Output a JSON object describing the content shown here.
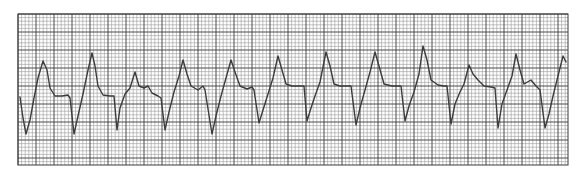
{
  "chart_data": {
    "type": "line",
    "title": "",
    "xlabel": "",
    "ylabel": "",
    "grid": true,
    "grid_box": {
      "x": 18,
      "y": 14,
      "width": 550,
      "height": 151
    },
    "grid_minor_px": 3.6,
    "grid_major_px": 18,
    "colors": {
      "paper": "#ffffff",
      "minor_grid": "#9a9a9a",
      "major_grid": "#3a3a3a",
      "trace": "#3c3c3c"
    },
    "trace_points": [
      [
        20,
        97
      ],
      [
        23,
        118
      ],
      [
        26,
        134
      ],
      [
        30,
        120
      ],
      [
        34,
        98
      ],
      [
        38,
        78
      ],
      [
        43,
        61
      ],
      [
        47,
        70
      ],
      [
        50,
        88
      ],
      [
        55,
        96
      ],
      [
        62,
        96
      ],
      [
        68,
        95
      ],
      [
        70,
        98
      ],
      [
        74,
        134
      ],
      [
        78,
        116
      ],
      [
        83,
        94
      ],
      [
        88,
        70
      ],
      [
        92,
        53
      ],
      [
        95,
        66
      ],
      [
        98,
        86
      ],
      [
        103,
        95
      ],
      [
        110,
        96
      ],
      [
        114,
        96
      ],
      [
        117,
        130
      ],
      [
        120,
        108
      ],
      [
        125,
        94
      ],
      [
        130,
        88
      ],
      [
        135,
        72
      ],
      [
        139,
        86
      ],
      [
        144,
        88
      ],
      [
        148,
        86
      ],
      [
        152,
        93
      ],
      [
        158,
        96
      ],
      [
        161,
        98
      ],
      [
        165,
        130
      ],
      [
        169,
        112
      ],
      [
        174,
        92
      ],
      [
        179,
        76
      ],
      [
        183,
        60
      ],
      [
        187,
        74
      ],
      [
        191,
        86
      ],
      [
        198,
        90
      ],
      [
        203,
        86
      ],
      [
        205,
        90
      ],
      [
        212,
        134
      ],
      [
        216,
        116
      ],
      [
        221,
        96
      ],
      [
        226,
        78
      ],
      [
        231,
        60
      ],
      [
        235,
        72
      ],
      [
        240,
        86
      ],
      [
        247,
        89
      ],
      [
        252,
        87
      ],
      [
        254,
        90
      ],
      [
        259,
        123
      ],
      [
        263,
        110
      ],
      [
        268,
        94
      ],
      [
        273,
        78
      ],
      [
        278,
        56
      ],
      [
        282,
        70
      ],
      [
        286,
        84
      ],
      [
        292,
        86
      ],
      [
        300,
        86
      ],
      [
        304,
        86
      ],
      [
        307,
        121
      ],
      [
        311,
        108
      ],
      [
        315,
        96
      ],
      [
        320,
        82
      ],
      [
        326,
        52
      ],
      [
        330,
        66
      ],
      [
        334,
        84
      ],
      [
        340,
        86
      ],
      [
        348,
        86
      ],
      [
        351,
        86
      ],
      [
        356,
        125
      ],
      [
        360,
        108
      ],
      [
        365,
        90
      ],
      [
        370,
        72
      ],
      [
        375,
        52
      ],
      [
        379,
        66
      ],
      [
        384,
        84
      ],
      [
        392,
        86
      ],
      [
        398,
        86
      ],
      [
        401,
        86
      ],
      [
        405,
        121
      ],
      [
        409,
        106
      ],
      [
        414,
        92
      ],
      [
        419,
        74
      ],
      [
        423,
        46
      ],
      [
        427,
        60
      ],
      [
        431,
        80
      ],
      [
        438,
        85
      ],
      [
        444,
        86
      ],
      [
        447,
        86
      ],
      [
        451,
        124
      ],
      [
        455,
        104
      ],
      [
        460,
        92
      ],
      [
        464,
        84
      ],
      [
        469,
        65
      ],
      [
        473,
        74
      ],
      [
        478,
        80
      ],
      [
        484,
        86
      ],
      [
        491,
        87
      ],
      [
        495,
        88
      ],
      [
        498,
        128
      ],
      [
        502,
        104
      ],
      [
        507,
        90
      ],
      [
        512,
        76
      ],
      [
        516,
        54
      ],
      [
        520,
        70
      ],
      [
        524,
        84
      ],
      [
        531,
        80
      ],
      [
        536,
        86
      ],
      [
        540,
        90
      ],
      [
        545,
        128
      ],
      [
        549,
        114
      ],
      [
        553,
        96
      ],
      [
        558,
        76
      ],
      [
        563,
        56
      ],
      [
        566,
        62
      ]
    ],
    "complexes": [
      {
        "peak_x": 43,
        "peak_y": 61,
        "trough_x": 26,
        "trough_y": 134
      },
      {
        "peak_x": 92,
        "peak_y": 53,
        "trough_x": 74,
        "trough_y": 134
      },
      {
        "peak_x": 135,
        "peak_y": 72,
        "trough_x": 117,
        "trough_y": 130
      },
      {
        "peak_x": 183,
        "peak_y": 60,
        "trough_x": 165,
        "trough_y": 130
      },
      {
        "peak_x": 231,
        "peak_y": 60,
        "trough_x": 212,
        "trough_y": 134
      },
      {
        "peak_x": 278,
        "peak_y": 56,
        "trough_x": 259,
        "trough_y": 123
      },
      {
        "peak_x": 326,
        "peak_y": 52,
        "trough_x": 307,
        "trough_y": 121
      },
      {
        "peak_x": 375,
        "peak_y": 52,
        "trough_x": 356,
        "trough_y": 125
      },
      {
        "peak_x": 423,
        "peak_y": 46,
        "trough_x": 405,
        "trough_y": 121
      },
      {
        "peak_x": 469,
        "peak_y": 65,
        "trough_x": 451,
        "trough_y": 124
      },
      {
        "peak_x": 516,
        "peak_y": 54,
        "trough_x": 498,
        "trough_y": 128
      },
      {
        "peak_x": 563,
        "peak_y": 56,
        "trough_x": 545,
        "trough_y": 128
      }
    ],
    "legend": []
  }
}
